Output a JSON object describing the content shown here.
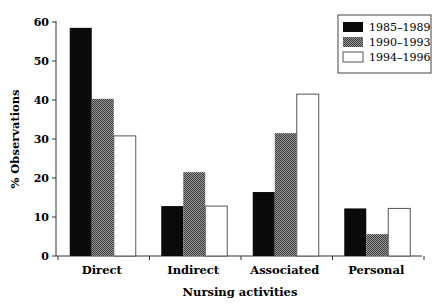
{
  "chart_data": {
    "type": "bar",
    "title": "",
    "xlabel": "Nursing activities",
    "ylabel": "% Observations",
    "ylim": [
      0,
      60
    ],
    "yticks": [
      0,
      10,
      20,
      30,
      40,
      50,
      60
    ],
    "grid": false,
    "legend_position": "top-right",
    "categories": [
      "Direct",
      "Indirect",
      "Associated",
      "Personal"
    ],
    "series": [
      {
        "name": "1985–1989",
        "fill": "#0a0a0a",
        "pattern": "solid-black",
        "values": [
          58.5,
          12.8,
          16.4,
          12.2
        ]
      },
      {
        "name": "1990–1993",
        "fill": "#6e6e6e",
        "pattern": "crosshatch-gray",
        "values": [
          40.3,
          21.5,
          31.5,
          5.6
        ]
      },
      {
        "name": "1994–1996",
        "fill": "#ffffff",
        "pattern": "white",
        "values": [
          30.8,
          12.8,
          41.5,
          12.2
        ]
      }
    ]
  }
}
